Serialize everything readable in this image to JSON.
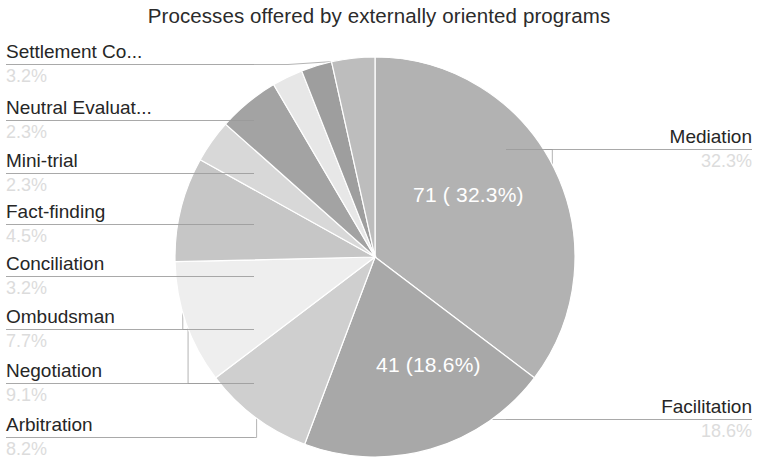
{
  "chart_data": {
    "type": "pie",
    "title": "Processes offered by externally oriented programs",
    "total": 220,
    "start_angle_deg": 0,
    "direction": "clockwise",
    "legend": "none",
    "categories": [
      "Mediation",
      "Facilitation",
      "Arbitration",
      "Negotiation",
      "Ombudsman",
      "Conciliation",
      "Fact-finding",
      "Mini-trial",
      "Neutral Evaluation",
      "Settlement Conference"
    ],
    "values": [
      71,
      41,
      18,
      20,
      17,
      7,
      10,
      5,
      5,
      7
    ],
    "percentages": [
      32.3,
      18.6,
      8.2,
      9.1,
      7.7,
      3.2,
      4.5,
      2.3,
      2.3,
      3.2
    ],
    "slice_colors": [
      "#b2b2b2",
      "#a8a8a8",
      "#cfcfcf",
      "#eeeeee",
      "#c6c6c6",
      "#d8d8d8",
      "#a3a3a3",
      "#e7e7e7",
      "#9e9e9e",
      "#bdbdbd"
    ],
    "inner_labels": [
      {
        "text": "71 ( 32.3%)",
        "slice": "Mediation"
      },
      {
        "text": "41 (18.6%)",
        "slice": "Facilitation"
      }
    ]
  },
  "title": "Processes offered by externally oriented programs",
  "callouts": {
    "left": [
      {
        "category": "Settlement Co...",
        "percent": "3.2%"
      },
      {
        "category": "Neutral Evaluat...",
        "percent": "2.3%"
      },
      {
        "category": "Mini-trial",
        "percent": "2.3%"
      },
      {
        "category": "Fact-finding",
        "percent": "4.5%"
      },
      {
        "category": "Conciliation",
        "percent": "3.2%"
      },
      {
        "category": "Ombudsman",
        "percent": "7.7%"
      },
      {
        "category": "Negotiation",
        "percent": "9.1%"
      },
      {
        "category": "Arbitration",
        "percent": "8.2%"
      }
    ],
    "right": [
      {
        "category": "Mediation",
        "percent": "32.3%"
      },
      {
        "category": "Facilitation",
        "percent": "18.6%"
      }
    ]
  },
  "inner": {
    "mediation": "71 ( 32.3%)",
    "facilitation": "41 (18.6%)"
  }
}
